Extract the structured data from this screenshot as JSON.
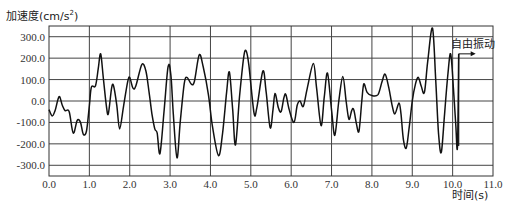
{
  "chart_data": {
    "type": "line",
    "title": "",
    "ylabel": "加速度(cm/s²)",
    "ylabel_main": "加速度(cm/s",
    "ylabel_sup": "2",
    "ylabel_close": ")",
    "xlabel": "时间(s)",
    "xlim": [
      0,
      11
    ],
    "ylim": [
      -350,
      350
    ],
    "grid": true,
    "x_ticks": [
      0,
      1,
      2,
      3,
      4,
      5,
      6,
      7,
      8,
      9,
      10,
      11
    ],
    "x_tick_labels": [
      "0.0",
      "1.0",
      "2.0",
      "3.0",
      "4.0",
      "5.0",
      "6.0",
      "7.0",
      "8.0",
      "9.0",
      "10.0",
      "11.0"
    ],
    "y_ticks": [
      300,
      200,
      100,
      0,
      -100,
      -200,
      -300
    ],
    "y_tick_labels": [
      "300.0",
      "200.0",
      "100.0",
      "0.0",
      "-100.0",
      "-200.0",
      "-300.0"
    ],
    "annotation": {
      "text": "自由振动",
      "t": 10.15,
      "value": 220
    },
    "series": [
      {
        "name": "acceleration",
        "color": "#111111",
        "points": [
          [
            0.0,
            -40
          ],
          [
            0.08,
            -70
          ],
          [
            0.15,
            -45
          ],
          [
            0.25,
            20
          ],
          [
            0.33,
            -20
          ],
          [
            0.4,
            -45
          ],
          [
            0.5,
            -50
          ],
          [
            0.6,
            -150
          ],
          [
            0.7,
            -90
          ],
          [
            0.78,
            -100
          ],
          [
            0.85,
            -155
          ],
          [
            0.93,
            -140
          ],
          [
            1.0,
            -20
          ],
          [
            1.05,
            65
          ],
          [
            1.15,
            70
          ],
          [
            1.22,
            150
          ],
          [
            1.28,
            220
          ],
          [
            1.35,
            100
          ],
          [
            1.42,
            -20
          ],
          [
            1.47,
            -60
          ],
          [
            1.55,
            60
          ],
          [
            1.6,
            70
          ],
          [
            1.68,
            -20
          ],
          [
            1.75,
            -130
          ],
          [
            1.85,
            -20
          ],
          [
            1.95,
            90
          ],
          [
            2.0,
            110
          ],
          [
            2.08,
            60
          ],
          [
            2.15,
            70
          ],
          [
            2.3,
            170
          ],
          [
            2.4,
            140
          ],
          [
            2.48,
            40
          ],
          [
            2.55,
            -60
          ],
          [
            2.62,
            -130
          ],
          [
            2.68,
            -150
          ],
          [
            2.75,
            -245
          ],
          [
            2.85,
            -50
          ],
          [
            2.95,
            160
          ],
          [
            3.02,
            120
          ],
          [
            3.08,
            -60
          ],
          [
            3.17,
            -265
          ],
          [
            3.25,
            -100
          ],
          [
            3.35,
            80
          ],
          [
            3.42,
            110
          ],
          [
            3.52,
            80
          ],
          [
            3.6,
            90
          ],
          [
            3.72,
            215
          ],
          [
            3.82,
            160
          ],
          [
            3.95,
            30
          ],
          [
            4.05,
            -120
          ],
          [
            4.2,
            -255
          ],
          [
            4.3,
            -150
          ],
          [
            4.4,
            40
          ],
          [
            4.47,
            135
          ],
          [
            4.55,
            -40
          ],
          [
            4.62,
            -205
          ],
          [
            4.72,
            20
          ],
          [
            4.82,
            200
          ],
          [
            4.88,
            235
          ],
          [
            4.95,
            170
          ],
          [
            5.08,
            -55
          ],
          [
            5.15,
            -30
          ],
          [
            5.3,
            140
          ],
          [
            5.38,
            40
          ],
          [
            5.48,
            -125
          ],
          [
            5.55,
            -40
          ],
          [
            5.6,
            35
          ],
          [
            5.68,
            -30
          ],
          [
            5.75,
            -50
          ],
          [
            5.82,
            15
          ],
          [
            5.87,
            30
          ],
          [
            5.95,
            -40
          ],
          [
            6.07,
            -100
          ],
          [
            6.15,
            -20
          ],
          [
            6.22,
            0
          ],
          [
            6.3,
            -25
          ],
          [
            6.4,
            60
          ],
          [
            6.55,
            175
          ],
          [
            6.63,
            60
          ],
          [
            6.74,
            -115
          ],
          [
            6.82,
            20
          ],
          [
            6.9,
            130
          ],
          [
            7.0,
            -40
          ],
          [
            7.08,
            -160
          ],
          [
            7.18,
            0
          ],
          [
            7.28,
            115
          ],
          [
            7.36,
            0
          ],
          [
            7.43,
            -85
          ],
          [
            7.5,
            -45
          ],
          [
            7.55,
            -40
          ],
          [
            7.62,
            -110
          ],
          [
            7.68,
            -140
          ],
          [
            7.75,
            0
          ],
          [
            7.8,
            80
          ],
          [
            7.88,
            40
          ],
          [
            8.0,
            25
          ],
          [
            8.15,
            30
          ],
          [
            8.25,
            90
          ],
          [
            8.33,
            125
          ],
          [
            8.42,
            60
          ],
          [
            8.5,
            -20
          ],
          [
            8.57,
            -60
          ],
          [
            8.67,
            -10
          ],
          [
            8.72,
            -60
          ],
          [
            8.78,
            -180
          ],
          [
            8.85,
            -220
          ],
          [
            8.92,
            -130
          ],
          [
            9.0,
            0
          ],
          [
            9.08,
            80
          ],
          [
            9.15,
            110
          ],
          [
            9.22,
            70
          ],
          [
            9.3,
            40
          ],
          [
            9.38,
            180
          ],
          [
            9.5,
            340
          ],
          [
            9.58,
            100
          ],
          [
            9.65,
            -150
          ],
          [
            9.72,
            -240
          ],
          [
            9.8,
            -60
          ],
          [
            9.88,
            120
          ],
          [
            9.95,
            220
          ],
          [
            10.02,
            60
          ],
          [
            10.08,
            -120
          ],
          [
            10.12,
            -210
          ],
          [
            10.15,
            220
          ]
        ]
      }
    ]
  }
}
